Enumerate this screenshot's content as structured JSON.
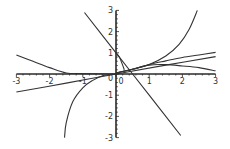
{
  "chart_data": {
    "type": "line",
    "title": "",
    "xlabel": "",
    "ylabel": "",
    "xlim": [
      -3,
      3
    ],
    "ylim": [
      -3,
      3
    ],
    "grid": false,
    "legend": null,
    "x_ticks": [
      "-3",
      "-2",
      "-1",
      "0",
      "1",
      "2",
      "3"
    ],
    "y_ticks": [
      "3",
      "2",
      "1",
      "0",
      "-1",
      "-2",
      "-3"
    ],
    "colors": {
      "axis": "#2a2a2a",
      "curve": "#333333",
      "background": "#ffffff"
    },
    "series": [
      {
        "name": "steep-line",
        "points": [
          [
            -0.95,
            2.9
          ],
          [
            0,
            1
          ],
          [
            1,
            -1
          ],
          [
            1.95,
            -2.9
          ]
        ]
      },
      {
        "name": "shallow-line",
        "points": [
          [
            -3,
            -0.85
          ],
          [
            -1.5,
            -0.43
          ],
          [
            0,
            0
          ],
          [
            1.5,
            0.42
          ],
          [
            3,
            0.82
          ]
        ]
      },
      {
        "name": "blowup-right",
        "points": [
          [
            0,
            0.05
          ],
          [
            0.5,
            0.22
          ],
          [
            1,
            0.45
          ],
          [
            1.5,
            0.85
          ],
          [
            1.9,
            1.4
          ],
          [
            2.2,
            2.1
          ],
          [
            2.45,
            3
          ]
        ]
      },
      {
        "name": "blowup-left",
        "points": [
          [
            -1.55,
            -3
          ],
          [
            -1.5,
            -2.3
          ],
          [
            -1.3,
            -1.3
          ],
          [
            -1,
            -0.65
          ],
          [
            -0.7,
            -0.3
          ],
          [
            -0.4,
            -0.08
          ],
          [
            0,
            0
          ]
        ]
      },
      {
        "name": "rising-curve",
        "points": [
          [
            0,
            0.05
          ],
          [
            0.5,
            0.22
          ],
          [
            1,
            0.45
          ],
          [
            1.5,
            0.62
          ],
          [
            2,
            0.78
          ],
          [
            2.5,
            0.9
          ],
          [
            3,
            1.02
          ]
        ]
      },
      {
        "name": "hump-curve",
        "points": [
          [
            0,
            0.05
          ],
          [
            0.5,
            0.22
          ],
          [
            1,
            0.42
          ],
          [
            1.5,
            0.44
          ],
          [
            2,
            0.38
          ],
          [
            2.5,
            0.3
          ],
          [
            3,
            0.15
          ]
        ]
      },
      {
        "name": "decay-left",
        "points": [
          [
            -3,
            0.9
          ],
          [
            -2.5,
            0.6
          ],
          [
            -2,
            0.3
          ],
          [
            -1.5,
            0.05
          ],
          [
            -1,
            0.02
          ],
          [
            0,
            0
          ]
        ]
      },
      {
        "name": "short-curve",
        "points": [
          [
            0,
            1
          ],
          [
            0.1,
            0.8
          ],
          [
            0.18,
            0.5
          ],
          [
            0.25,
            0.2
          ]
        ]
      }
    ]
  }
}
